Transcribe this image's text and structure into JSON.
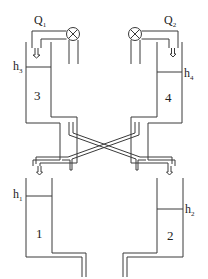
{
  "diagram": {
    "title": "",
    "inflows": [
      {
        "id": "Q1",
        "label_main": "Q",
        "label_sub": "1"
      },
      {
        "id": "Q2",
        "label_main": "Q",
        "label_sub": "2"
      }
    ],
    "tanks": [
      {
        "id": "tank-3",
        "number": "3",
        "level_main": "h",
        "level_sub": "3"
      },
      {
        "id": "tank-4",
        "number": "4",
        "level_main": "h",
        "level_sub": "4"
      },
      {
        "id": "tank-1",
        "number": "1",
        "level_main": "h",
        "level_sub": "1"
      },
      {
        "id": "tank-2",
        "number": "2",
        "level_main": "h",
        "level_sub": "2"
      }
    ],
    "valves": [
      {
        "id": "valve-1",
        "symbol": "⊗"
      },
      {
        "id": "valve-2",
        "symbol": "⊗"
      }
    ],
    "colors": {
      "line": "#3a3a3a",
      "background": "#ffffff"
    }
  }
}
